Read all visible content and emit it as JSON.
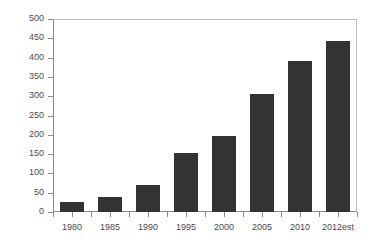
{
  "chart_data": {
    "type": "bar",
    "title": "",
    "subtitle": "",
    "xlabel": "",
    "ylabel": "",
    "categories": [
      "1980",
      "1985",
      "1990",
      "1995",
      "2000",
      "2005",
      "2010",
      "2012est"
    ],
    "values": [
      25,
      40,
      70,
      153,
      198,
      305,
      390,
      443
    ],
    "ylim": [
      0,
      500
    ],
    "ytick_labels": [
      "0",
      "50",
      "100",
      "150",
      "200",
      "250",
      "300",
      "350",
      "400",
      "450",
      "500"
    ],
    "ytick_values": [
      0,
      50,
      100,
      150,
      200,
      250,
      300,
      350,
      400,
      450,
      500
    ],
    "grid": false,
    "legend": null,
    "legend_position": "none",
    "bar_color": "#333333",
    "axis_color": "#8a8a8a",
    "frame_color": "#b9b9b9",
    "tick_label_color": "#4a4a4a",
    "background": "#ffffff",
    "annotations": []
  }
}
